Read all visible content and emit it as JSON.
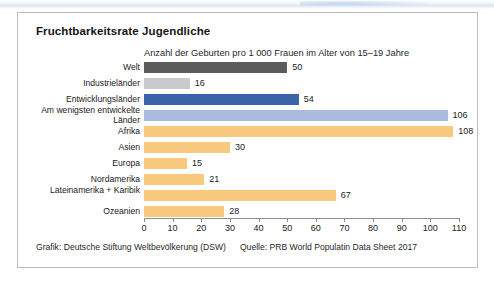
{
  "card": {
    "title": "Fruchtbarkeitsrate Jugendliche",
    "subtitle": "Anzahl der Geburten pro 1 000 Frauen im Alter von 15–19 Jahre",
    "footer_credit": "Grafik: Deutsche Stiftung Weltbevölkerung (DSW)",
    "footer_source": "Quelle: PRB World Populatin Data Sheet 2017"
  },
  "colors": {
    "dark_gray": "#5b5b5d",
    "light_gray": "#c9cacb",
    "blue": "#3a63a9",
    "light_blue": "#a9bbdf",
    "orange": "#f8c97e",
    "axis": "#8b8d8f",
    "border": "#b9bcbe",
    "text": "#1a1a1a"
  },
  "chart_data": {
    "type": "bar",
    "orientation": "horizontal",
    "title": "Fruchtbarkeitsrate Jugendliche",
    "subtitle": "Anzahl der Geburten pro 1 000 Frauen im Alter von 15–19 Jahre",
    "xlabel": "",
    "ylabel": "",
    "xlim": [
      0,
      110
    ],
    "grid": false,
    "legend": "none",
    "xticks": [
      0,
      10,
      20,
      30,
      40,
      50,
      60,
      70,
      80,
      90,
      100,
      110
    ],
    "categories": [
      "Welt",
      "Industrieländer",
      "Entwicklungsländer",
      "Am wenigsten entwickelte Länder",
      "Afrika",
      "Asien",
      "Europa",
      "Nordamerika",
      "Lateinamerika + Karibik",
      "Ozeanien"
    ],
    "values": [
      50,
      16,
      54,
      106,
      108,
      30,
      15,
      21,
      67,
      28
    ],
    "bar_colors": [
      "#5b5b5d",
      "#c9cacb",
      "#3a63a9",
      "#a9bbdf",
      "#f8c97e",
      "#f8c97e",
      "#f8c97e",
      "#f8c97e",
      "#f8c97e",
      "#f8c97e"
    ],
    "value_labels": [
      "50",
      "16",
      "54",
      "106",
      "108",
      "30",
      "15",
      "21",
      "67",
      "28"
    ]
  }
}
